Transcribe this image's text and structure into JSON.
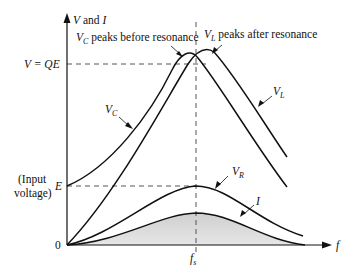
{
  "diagram": {
    "axes": {
      "y_label_var": "V",
      "y_label_rest": " and ",
      "y_label_var2": "I",
      "x_label": "f",
      "origin_label": "0",
      "x_tick_var": "f",
      "x_tick_sub": "s"
    },
    "levels": {
      "qe_label": "V = QE",
      "e_label": "E",
      "input_line1": "(Input",
      "input_line2": "voltage)"
    },
    "annotations": {
      "vc_peak_var": "V",
      "vc_peak_sub": "C",
      "vc_peak_text": " peaks before resonance",
      "vl_peak_var": "V",
      "vl_peak_sub": "L",
      "vl_peak_text": " peaks after resonance"
    },
    "curves": {
      "vc": {
        "var": "V",
        "sub": "C"
      },
      "vl": {
        "var": "V",
        "sub": "L"
      },
      "vr": {
        "var": "V",
        "sub": "R"
      },
      "i": {
        "var": "I"
      }
    },
    "colors": {
      "line": "#111111",
      "fill": "#d9d9d9",
      "dash": "#555555"
    }
  }
}
